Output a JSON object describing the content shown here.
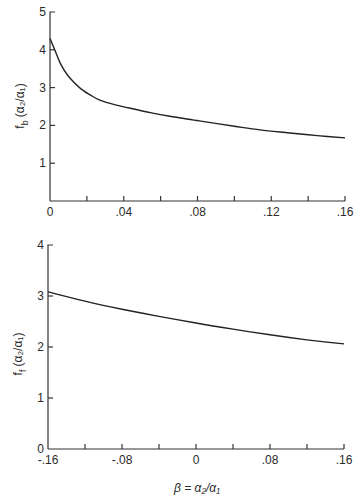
{
  "chart_data": [
    {
      "type": "line",
      "title": "",
      "ylabel_main": "f",
      "ylabel_sub": "b",
      "ylabel_rest": "(α₂/α₁)",
      "xlabel": "",
      "xlim": [
        0,
        0.16
      ],
      "ylim": [
        0,
        5
      ],
      "x_ticks": [
        0,
        0.02,
        0.04,
        0.06,
        0.08,
        0.1,
        0.12,
        0.14,
        0.16
      ],
      "x_tick_labels": [
        {
          "value": 0,
          "label": "0"
        },
        {
          "value": 0.04,
          "label": ".04"
        },
        {
          "value": 0.08,
          "label": ".08"
        },
        {
          "value": 0.12,
          "label": ".12"
        },
        {
          "value": 0.16,
          "label": ".16"
        }
      ],
      "y_tick_labels": [
        {
          "value": 1,
          "label": "1"
        },
        {
          "value": 2,
          "label": "2"
        },
        {
          "value": 3,
          "label": "3"
        },
        {
          "value": 4,
          "label": "4"
        },
        {
          "value": 5,
          "label": "5"
        }
      ],
      "grid": false,
      "series": [
        {
          "name": "f_b",
          "x": [
            0,
            0.003,
            0.006,
            0.01,
            0.016,
            0.022,
            0.027,
            0.035,
            0.043,
            0.055,
            0.065,
            0.081,
            0.1,
            0.114,
            0.13,
            0.145,
            0.16
          ],
          "y": [
            4.3,
            3.95,
            3.6,
            3.3,
            3.0,
            2.8,
            2.67,
            2.55,
            2.46,
            2.33,
            2.24,
            2.12,
            1.98,
            1.88,
            1.8,
            1.73,
            1.67
          ]
        }
      ]
    },
    {
      "type": "line",
      "title": "",
      "ylabel_main": "f",
      "ylabel_sub": "f",
      "ylabel_rest": "(α₂/α₁)",
      "xlabel": "β = α₂/α₁",
      "xlim": [
        -0.16,
        0.16
      ],
      "ylim": [
        0,
        4
      ],
      "x_ticks": [
        -0.16,
        -0.12,
        -0.08,
        -0.04,
        0,
        0.04,
        0.08,
        0.12,
        0.16
      ],
      "x_tick_labels": [
        {
          "value": -0.16,
          "label": "-.16"
        },
        {
          "value": -0.08,
          "label": "-.08"
        },
        {
          "value": 0,
          "label": "0"
        },
        {
          "value": 0.08,
          "label": ".08"
        },
        {
          "value": 0.16,
          "label": ".16"
        }
      ],
      "y_tick_labels": [
        {
          "value": 0,
          "label": "0"
        },
        {
          "value": 1,
          "label": "1"
        },
        {
          "value": 2,
          "label": "2"
        },
        {
          "value": 3,
          "label": "3"
        },
        {
          "value": 4,
          "label": "4"
        }
      ],
      "grid": false,
      "series": [
        {
          "name": "f_f",
          "x": [
            -0.16,
            -0.12,
            -0.08,
            -0.04,
            0,
            0.04,
            0.08,
            0.12,
            0.16
          ],
          "y": [
            3.08,
            2.9,
            2.74,
            2.6,
            2.47,
            2.35,
            2.24,
            2.14,
            2.06
          ]
        }
      ]
    }
  ]
}
